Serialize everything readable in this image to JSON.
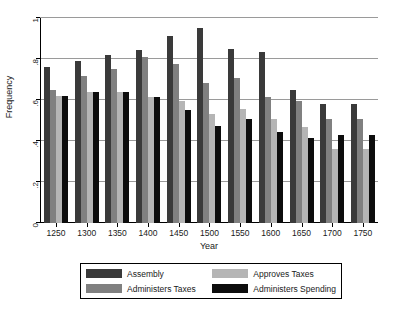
{
  "chart_data": {
    "type": "bar",
    "title": "",
    "xlabel": "Year",
    "ylabel": "Frequency",
    "ylim": [
      0,
      1
    ],
    "yticks": [
      0,
      0.2,
      0.4,
      0.6,
      0.8,
      1
    ],
    "ytick_labels": [
      "0",
      ".2",
      ".4",
      ".6",
      ".8",
      "1"
    ],
    "grid": true,
    "legend_position": "below",
    "categories": [
      1250,
      1300,
      1350,
      1400,
      1450,
      1500,
      1550,
      1600,
      1650,
      1700,
      1750
    ],
    "xtick_labels": [
      "1250",
      "1300",
      "1350",
      "1400",
      "1450",
      "1500",
      "1550",
      "1600",
      "1650",
      "1700",
      "1750"
    ],
    "series": [
      {
        "name": "Assembly",
        "color": "#3a3a3a",
        "values": [
          0.76,
          0.79,
          0.82,
          0.845,
          0.91,
          0.95,
          0.85,
          0.835,
          0.65,
          0.58,
          0.58
        ]
      },
      {
        "name": "Administers Taxes",
        "color": "#808080",
        "values": [
          0.65,
          0.715,
          0.75,
          0.81,
          0.775,
          0.685,
          0.705,
          0.615,
          0.595,
          0.505,
          0.505
        ]
      },
      {
        "name": "Approves Taxes",
        "color": "#b5b5b5",
        "values": [
          0.62,
          0.64,
          0.64,
          0.615,
          0.595,
          0.53,
          0.555,
          0.505,
          0.47,
          0.36,
          0.36
        ]
      },
      {
        "name": "Administers Spending",
        "color": "#0d0d0d",
        "values": [
          0.62,
          0.64,
          0.64,
          0.615,
          0.55,
          0.475,
          0.505,
          0.445,
          0.415,
          0.43,
          0.43
        ]
      }
    ]
  },
  "legend": {
    "entries": [
      {
        "label": "Assembly",
        "color": "#3a3a3a"
      },
      {
        "label": "Approves Taxes",
        "color": "#b5b5b5"
      },
      {
        "label": "Administers Taxes",
        "color": "#808080"
      },
      {
        "label": "Administers Spending",
        "color": "#0d0d0d"
      }
    ]
  }
}
